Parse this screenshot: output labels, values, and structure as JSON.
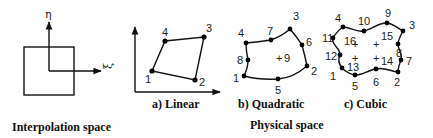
{
  "interpolation": {
    "axis_eta": "η",
    "axis_xi": "ξ",
    "caption": "Interpolation space"
  },
  "physical_caption": "Physical space",
  "linear": {
    "caption": "a) Linear",
    "nodes": [
      "1",
      "2",
      "3",
      "4"
    ]
  },
  "quadratic": {
    "caption": "b) Quadratic",
    "nodes": [
      "1",
      "2",
      "3",
      "4",
      "5",
      "6",
      "7",
      "8"
    ],
    "interior": [
      "9"
    ]
  },
  "cubic": {
    "caption": "c) Cubic",
    "nodes": [
      "1",
      "2",
      "3",
      "4",
      "5",
      "6",
      "7",
      "8",
      "9",
      "10",
      "11",
      "12"
    ],
    "interior": [
      "13",
      "14",
      "15",
      "16"
    ]
  }
}
